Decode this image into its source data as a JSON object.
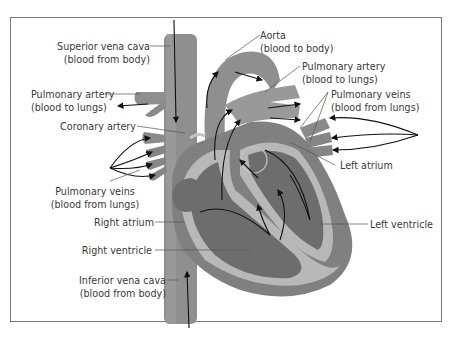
{
  "figure": {
    "colors": {
      "vessel": "#8f8f8f",
      "muscle": "#7e7e7e",
      "chamber_dark": "#6d6d6d",
      "chamber_light": "#b8b8b8",
      "arrow": "#111111",
      "leader": "#555555",
      "label": "#3a3a3a",
      "border": "#7a7a7a"
    }
  },
  "labels": {
    "superior_vena_cava": {
      "line1": "Superior vena cava",
      "line2": "(blood from body)"
    },
    "aorta": {
      "line1": "Aorta",
      "line2": "(blood to body)"
    },
    "pulmonary_artery_left": {
      "line1": "Pulmonary artery",
      "line2": "(blood to lungs)"
    },
    "pulmonary_artery_right": {
      "line1": "Pulmonary artery",
      "line2": "(blood to lungs)"
    },
    "pulmonary_veins_right": {
      "line1": "Pulmonary veins",
      "line2": "(blood from lungs)"
    },
    "coronary_artery": {
      "line1": "Coronary artery"
    },
    "left_atrium": {
      "line1": "Left atrium"
    },
    "pulmonary_veins_left": {
      "line1": "Pulmonary veins",
      "line2": "(blood from lungs)"
    },
    "right_atrium": {
      "line1": "Right atrium"
    },
    "left_ventricle": {
      "line1": "Left ventricle"
    },
    "right_ventricle": {
      "line1": "Right ventricle"
    },
    "inferior_vena_cava": {
      "line1": "Inferior vena cava",
      "line2": "(blood from body)"
    }
  }
}
